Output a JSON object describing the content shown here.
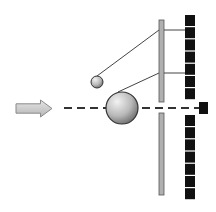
{
  "diagram": {
    "colors": {
      "background": "#ffffff",
      "arrow_fill": "#c8c8c8",
      "arrow_stroke": "#8a8a8a",
      "axis_line": "#333333",
      "sphere_light": "#eeeeee",
      "sphere_dark": "#7a7a7a",
      "sphere_stroke": "#333333",
      "plate_fill": "#b0b0b0",
      "plate_stroke": "#555555",
      "tether": "#444444",
      "detector": "#111111"
    },
    "incoming_arrow": {
      "x": 16,
      "y": 100,
      "w": 36,
      "h": 17
    },
    "axis": {
      "y": 108,
      "x_start": 64,
      "x_end": 200,
      "dash": "8 5"
    },
    "large_sphere": {
      "cx": 122,
      "cy": 108,
      "r": 16
    },
    "small_sphere": {
      "cx": 97,
      "cy": 82,
      "r": 6
    },
    "plate": {
      "x": 159,
      "w": 5,
      "upper": {
        "y": 20,
        "h": 82
      },
      "lower": {
        "y": 113,
        "h": 82
      }
    },
    "tethers": [
      {
        "from": [
          97,
          76
        ],
        "to": [
          159,
          30
        ]
      },
      {
        "from": [
          118,
          92
        ],
        "to": [
          159,
          73
        ]
      }
    ],
    "connectors": [
      {
        "y": 30,
        "x1": 164,
        "x2": 185
      },
      {
        "y": 73,
        "x1": 164,
        "x2": 185
      }
    ],
    "detector_column": {
      "x": 185,
      "w": 10,
      "cell_h": 11,
      "gap": 1.2,
      "upper_start": 15,
      "upper_count": 7,
      "lower_start": 115,
      "lower_count": 7
    },
    "axis_detector": {
      "x": 199,
      "y": 102,
      "w": 9,
      "h": 12
    }
  }
}
